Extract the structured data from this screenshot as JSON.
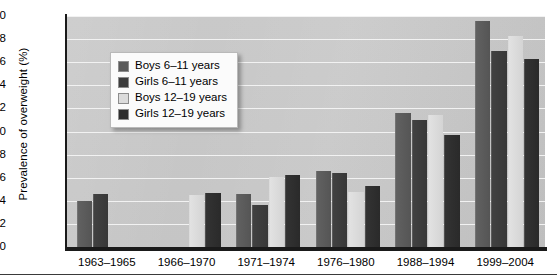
{
  "chart_data": {
    "type": "bar",
    "title": "",
    "subtitle": "",
    "xlabel": "",
    "ylabel": "Prevalence of overweight (%)",
    "ylim": [
      0,
      20
    ],
    "ytick_step": 2,
    "yticks": [
      0,
      2,
      4,
      6,
      8,
      10,
      12,
      14,
      16,
      18,
      20
    ],
    "grid": true,
    "grid_color": "#f2f2f2",
    "grid_axis": "y",
    "legend_position": "upper-left-inside",
    "plot_background": "#c7c7c7",
    "categories": [
      "1963–1965",
      "1966–1970",
      "1971–1974",
      "1976–1980",
      "1988–1994",
      "1999–2004"
    ],
    "series": [
      {
        "name": "Boys 6–11 years",
        "color": "#5a5a5a",
        "values": [
          4.0,
          null,
          4.6,
          6.6,
          11.6,
          19.6
        ]
      },
      {
        "name": "Girls 6–11 years",
        "color": "#3d3d3d",
        "values": [
          4.6,
          null,
          3.6,
          6.4,
          11.0,
          17.0
        ]
      },
      {
        "name": "Boys 12–19 years",
        "color": "#dcdcdc",
        "values": [
          null,
          4.5,
          6.1,
          4.8,
          11.4,
          18.3
        ]
      },
      {
        "name": "Girls 12–19 years",
        "color": "#2e2e2e",
        "values": [
          null,
          4.7,
          6.2,
          5.3,
          9.7,
          16.3
        ]
      }
    ]
  },
  "legend": {
    "items": [
      {
        "label": "Boys 6–11 years",
        "color": "#5a5a5a"
      },
      {
        "label": "Girls 6–11 years",
        "color": "#3d3d3d"
      },
      {
        "label": "Boys 12–19 years",
        "color": "#dcdcdc"
      },
      {
        "label": "Girls 12–19 years",
        "color": "#2e2e2e"
      }
    ]
  }
}
